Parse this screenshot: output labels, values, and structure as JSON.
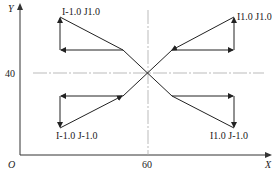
{
  "diagram": {
    "axes": {
      "x_label": "X",
      "y_label": "Y",
      "origin_label": "O",
      "x_tick_label": "60",
      "y_tick_label": "40"
    },
    "center": {
      "x": 60,
      "y": 40
    },
    "quadrants": [
      {
        "id": "upper-left",
        "label": "I-1.0 J1.0"
      },
      {
        "id": "upper-right",
        "label": "I1.0 J1.0"
      },
      {
        "id": "lower-left",
        "label": "I-1.0 J-1.0"
      },
      {
        "id": "lower-right",
        "label": "I1.0 J-1.0"
      }
    ],
    "colors": {
      "line": "#222222",
      "guide": "#999999"
    }
  }
}
